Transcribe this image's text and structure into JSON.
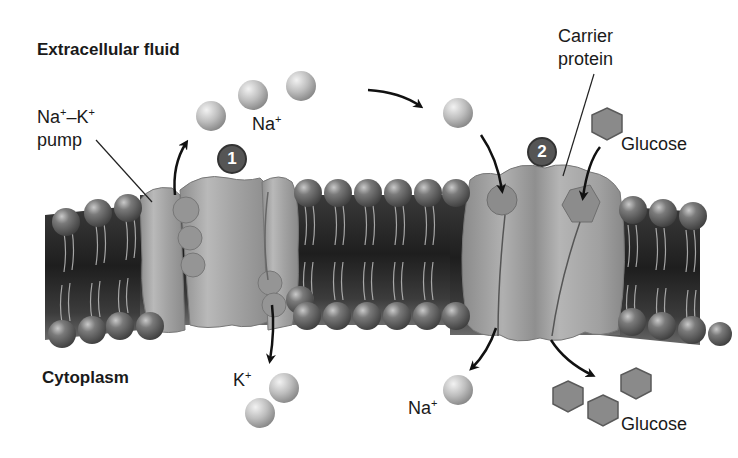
{
  "diagram": {
    "regions": {
      "extracellular": "Extracellular fluid",
      "cytoplasm": "Cytoplasm"
    },
    "labels": {
      "pump_line1_a": "Na",
      "pump_line1_sup1": "+",
      "pump_line1_dash": "–K",
      "pump_line1_sup2": "+",
      "pump_line2": "pump",
      "carrier_line1": "Carrier",
      "carrier_line2": "protein",
      "na_top": "Na",
      "na_top_sup": "+",
      "glucose_top": "Glucose",
      "k_bottom": "K",
      "k_bottom_sup": "+",
      "na_bottom": "Na",
      "na_bottom_sup": "+",
      "glucose_bottom": "Glucose"
    },
    "steps": [
      {
        "number": "1",
        "description": "Na+–K+ pump"
      },
      {
        "number": "2",
        "description": "Carrier protein (Na+/glucose symport)"
      }
    ],
    "colors": {
      "membrane_dark": "#2e2e2e",
      "phospholipid_head": "#6b6b6b",
      "protein": "#a9a9a9",
      "ion": "#bdbdbd",
      "glucose": "#8a8a8a",
      "badge": "#555555",
      "text": "#1a1a1a"
    }
  }
}
